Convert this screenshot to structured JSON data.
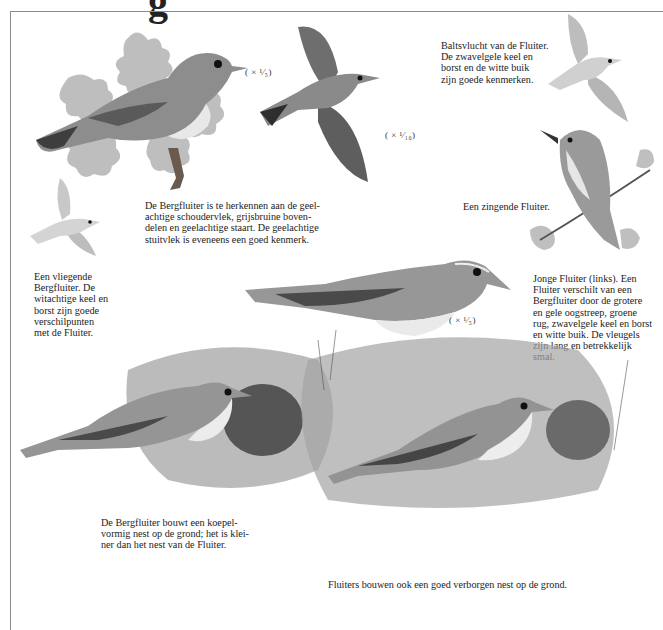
{
  "page": {
    "heading_fragment": "g",
    "frame": {
      "border_color": "#8a8a8a",
      "background": "#ffffff"
    }
  },
  "illustrations": [
    {
      "id": "bergfluiter-perched-oak",
      "subject": "Bergfluiter op eikentak",
      "scale": "(× ¹⁄₅)"
    },
    {
      "id": "bergfluiter-flying-top",
      "subject": "Vliegende vogel van onderen",
      "scale": "(× ¹⁄₁₀)"
    },
    {
      "id": "fluiter-display-flight",
      "subject": "Baltsvlucht van de Fluiter"
    },
    {
      "id": "fluiter-singing",
      "subject": "Zingende Fluiter op tak"
    },
    {
      "id": "bergfluiter-flying-small",
      "subject": "Vliegende Bergfluiter"
    },
    {
      "id": "fluiter-juvenile-perched",
      "subject": "Jonge Fluiter",
      "scale": "(× ¹⁄₅)"
    },
    {
      "id": "bergfluiter-nest",
      "subject": "Bergfluiter bij koepelvormig nest"
    },
    {
      "id": "fluiter-nest",
      "subject": "Fluiter bij nest op de grond"
    }
  ],
  "captions": {
    "baltsvlucht": "Baltsvlucht van de Fluiter.\nDe zwavelgele keel en\nborst en de witte buik\nzijn goede kenmerken.",
    "bergfluiter_herkennen": "De Bergfluiter is te herkennen aan de geel-\nachtige schoudervlek, grijsbruine boven-\ndelen en geelachtige staart. De geelachtige\nstuitvlek is eveneens een goed kenmerk.",
    "zingende": "Een zingende Fluiter.",
    "vliegende": "Een vliegende\nBergfluiter. De\nwitachtige keel en\nborst zijn goede\nverschilpunten\nmet de Fluiter.",
    "jonge_fluiter": "Jonge Fluiter (links). Een\nFluiter verschilt van een\nBergfluiter door de grotere\nen gele oogstreep, groene\nrug, zwavelgele keel en borst\nen witte buik. De vleugels\nzijn lang en betrekkelijk\nsmal.",
    "bergfluiter_nest": "De Bergfluiter bouwt een koepel-\nvormig nest op de grond; het is klei-\nner dan het nest van de Fluiter.",
    "fluiter_nest": "Fluiters bouwen ook een goed verborgen nest op de grond."
  },
  "scales": {
    "perched_top": "( × ¹⁄₅)",
    "flying_top": "( × ¹⁄₁₀)",
    "juvenile": "( × ¹⁄₅)"
  }
}
